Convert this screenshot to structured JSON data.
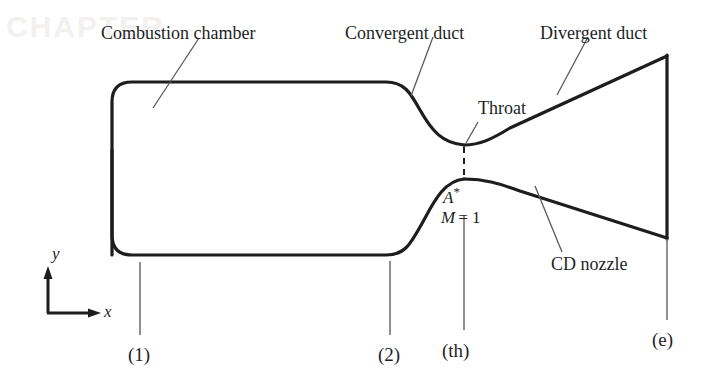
{
  "figure": {
    "type": "engineering-diagram",
    "background_color": "#ffffff",
    "line_color": "#1d1d1d"
  },
  "labels": {
    "combustion_chamber": "Combustion chamber",
    "convergent_duct": "Convergent duct",
    "divergent_duct": "Divergent duct",
    "throat": "Throat",
    "cd_nozzle": "CD nozzle",
    "area_star": "A",
    "area_star_sup": "*",
    "mach_symbol": "M",
    "mach_value": "= 1"
  },
  "axes": {
    "x_label": "x",
    "y_label": "y"
  },
  "stations": [
    {
      "name": "station-1",
      "label": "(1)"
    },
    {
      "name": "station-2",
      "label": "(2)"
    },
    {
      "name": "station-throat",
      "label": "(th)"
    },
    {
      "name": "station-exit",
      "label": "(e)"
    }
  ],
  "ghost_text": {
    "top_left": "CHAPTER"
  }
}
